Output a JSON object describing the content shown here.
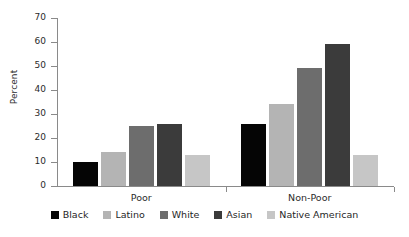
{
  "chart_data": {
    "type": "bar",
    "title": "",
    "subtitle": "",
    "xlabel": "",
    "ylabel": "Percent",
    "ylim": [
      0,
      70
    ],
    "yticks": [
      0,
      10,
      20,
      30,
      40,
      50,
      60,
      70
    ],
    "ytick_labels": [
      "0",
      "10",
      "20",
      "30",
      "40",
      "50",
      "60",
      "70"
    ],
    "grid": false,
    "legend_position": "bottom",
    "categories": [
      "Poor",
      "Non-Poor"
    ],
    "series": [
      {
        "name": "Black",
        "color": "#050505",
        "values": [
          10,
          26
        ]
      },
      {
        "name": "Latino",
        "color": "#b4b4b4",
        "values": [
          14,
          34
        ]
      },
      {
        "name": "White",
        "color": "#6d6d6d",
        "values": [
          25,
          49
        ]
      },
      {
        "name": "Asian",
        "color": "#3b3b3b",
        "values": [
          26,
          59
        ]
      },
      {
        "name": "Native American",
        "color": "#c6c6c6",
        "values": [
          13,
          13
        ]
      }
    ]
  },
  "axis": {
    "y_axis_title": "Percent"
  }
}
